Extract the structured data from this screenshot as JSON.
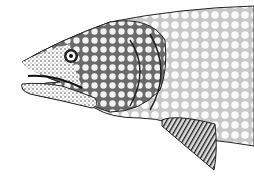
{
  "image": {
    "subject": "lake trout head illustration",
    "style": "black and white stipple drawing",
    "background": "#ffffff",
    "ink": "#1a1a1a"
  }
}
